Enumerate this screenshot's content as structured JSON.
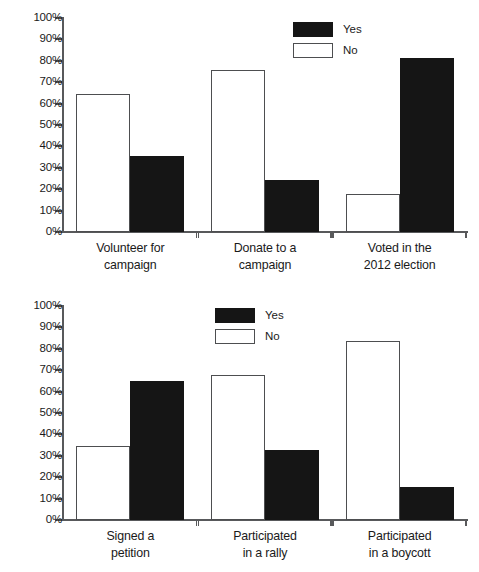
{
  "chart_data": [
    {
      "type": "bar",
      "panel": "top",
      "title": "",
      "xlabel": "",
      "ylabel": "",
      "ylim": [
        0,
        100
      ],
      "grid": false,
      "legend_position": "top-center-right",
      "categories": [
        "Volunteer for campaign",
        "Donate to a campaign",
        "Voted in the 2012 election"
      ],
      "category_lines": [
        [
          "Volunteer for",
          "campaign"
        ],
        [
          "Donate to a",
          "campaign"
        ],
        [
          "Voted in the",
          "2012 election"
        ]
      ],
      "series": [
        {
          "name": "No",
          "values": [
            64.5,
            75.5,
            17.8
          ]
        },
        {
          "name": "Yes",
          "values": [
            35.5,
            24.5,
            81.5
          ]
        }
      ],
      "series_order": [
        "No",
        "Yes"
      ],
      "tick_labels": [
        "100%",
        "90%",
        "80%",
        "70%",
        "60%",
        "50%",
        "40%",
        "30%",
        "20%",
        "10%",
        "0%"
      ],
      "tick_values": [
        100,
        90,
        80,
        70,
        60,
        50,
        40,
        30,
        20,
        10,
        0
      ],
      "legend": [
        {
          "label": "Yes",
          "swatch": "yes"
        },
        {
          "label": "No",
          "swatch": "no"
        }
      ]
    },
    {
      "type": "bar",
      "panel": "bottom",
      "title": "",
      "xlabel": "",
      "ylabel": "",
      "ylim": [
        0,
        100
      ],
      "grid": false,
      "legend_position": "top-center-right",
      "categories": [
        "Signed a petition",
        "Participated in a rally",
        "Participated in a boycott"
      ],
      "category_lines": [
        [
          "Signed a",
          "petition"
        ],
        [
          "Participated",
          "in a rally"
        ],
        [
          "Participated",
          "in a boycott"
        ]
      ],
      "series": [
        {
          "name": "No",
          "values": [
            34.5,
            67.6,
            83.5
          ]
        },
        {
          "name": "Yes",
          "values": [
            65.0,
            32.5,
            15.5
          ]
        }
      ],
      "series_order": [
        "No",
        "Yes"
      ],
      "tick_labels": [
        "100%",
        "90%",
        "80%",
        "70%",
        "60%",
        "50%",
        "40%",
        "30%",
        "20%",
        "10%",
        "0%"
      ],
      "tick_values": [
        100,
        90,
        80,
        70,
        60,
        50,
        40,
        30,
        20,
        10,
        0
      ],
      "legend": [
        {
          "label": "Yes",
          "swatch": "yes"
        },
        {
          "label": "No",
          "swatch": "no"
        }
      ]
    }
  ],
  "colors": {
    "yes_fill": "#151515",
    "no_fill": "#ffffff",
    "no_stroke": "#4d4e50",
    "axis": "#58595b",
    "text": "#1a1a1a",
    "background": "#ffffff"
  }
}
